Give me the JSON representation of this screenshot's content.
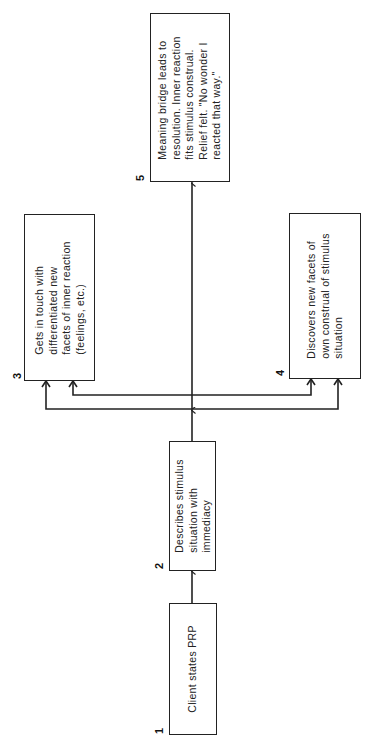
{
  "diagram": {
    "orientation": "rotated-90-ccw",
    "stroke_color": "#222222",
    "background": "#ffffff",
    "nodes": [
      {
        "id": "1",
        "number": "1",
        "text": "Client states PRP"
      },
      {
        "id": "2",
        "number": "2",
        "text": "Describes stimulus\nsituation with\nimmediacy"
      },
      {
        "id": "3",
        "number": "3",
        "text": "Gets in touch with\ndifferentiated new\nfacets of inner reaction\n(feelings, etc.)"
      },
      {
        "id": "4",
        "number": "4",
        "text": "Discovers new facets of\nown construal of stimulus\nsituation"
      },
      {
        "id": "5",
        "number": "5",
        "text": "Meaning bridge leads to\nresolution. Inner reaction\nfits stimulus construal.\nRelief felt. \"No wonder I\nreacted that way.\""
      }
    ],
    "edges": [
      {
        "from": "1",
        "to": "2"
      },
      {
        "from": "2",
        "to": "3"
      },
      {
        "from": "2",
        "to": "4"
      },
      {
        "from": "2",
        "to": "5"
      }
    ]
  }
}
